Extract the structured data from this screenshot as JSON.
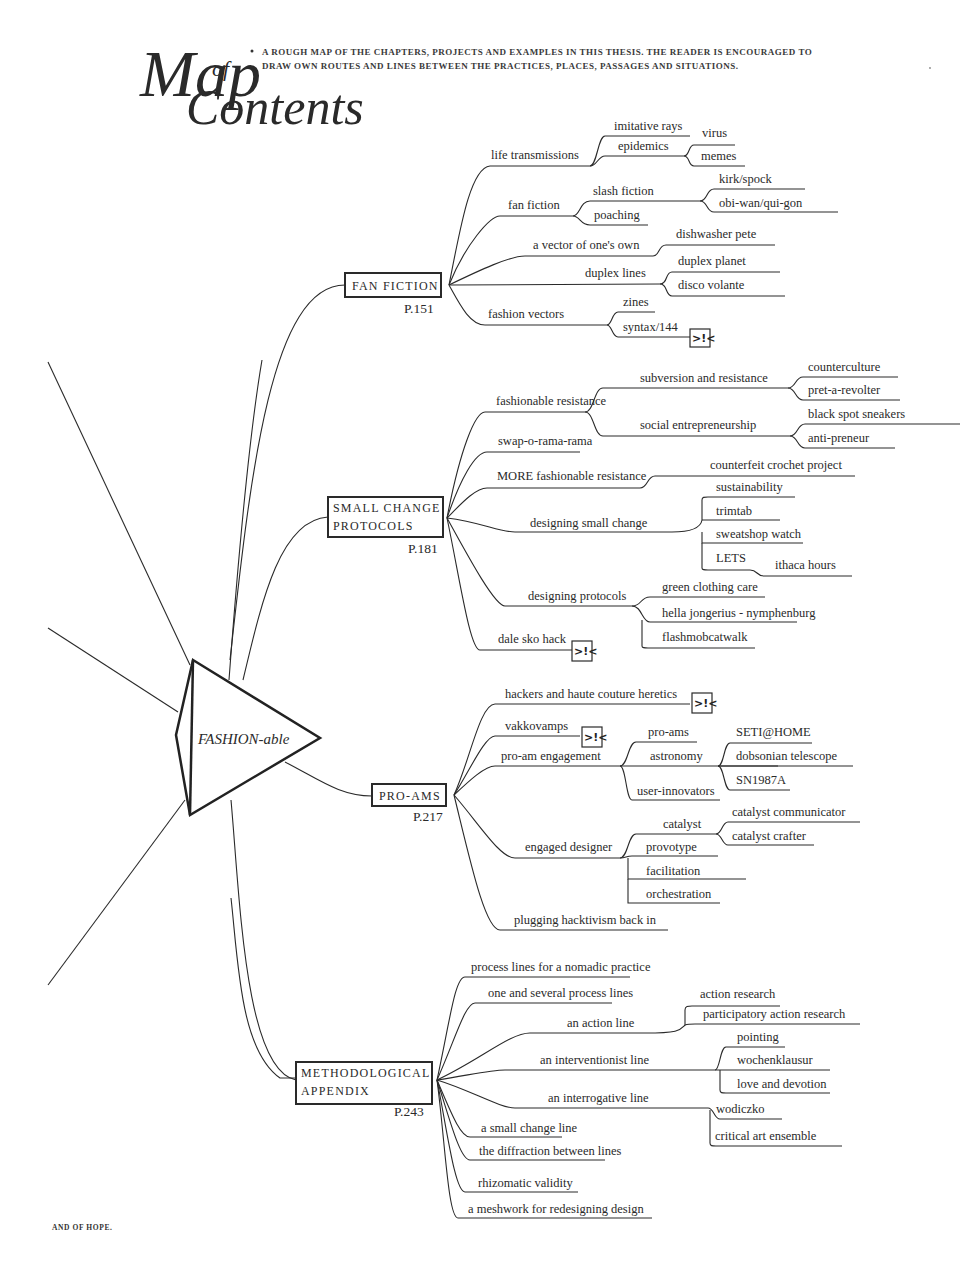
{
  "header": {
    "title_map": "Map",
    "title_of": "of",
    "title_contents": "Contents",
    "intro_line1": "A ROUGH MAP OF THE CHAPTERS, PROJECTS AND EXAMPLES IN THIS THESIS. THE READER IS ENCOURAGED TO",
    "intro_line2": "DRAW OWN ROUTES AND LINES BETWEEN THE PRACTICES, PLACES, PASSAGES AND SITUATIONS."
  },
  "center": {
    "label": "FASHION-able",
    "icon": "triangle-node-icon"
  },
  "footer": {
    "text": "AND OF HOPE."
  },
  "crossref_icon": {
    "glyph": ">!<",
    "name": "crossref-icon"
  },
  "chapters": {
    "fan_fiction": {
      "title": "FAN FICTION",
      "page": "P.151",
      "branches": {
        "life_transmissions": "life transmissions",
        "imitative_rays": "imitative rays",
        "epidemics": "epidemics",
        "virus": "virus",
        "memes": "memes",
        "fan_fiction": "fan fiction",
        "slash_fiction": "slash fiction",
        "kirk_spock": "kirk/spock",
        "obi_wan": "obi-wan/qui-gon",
        "poaching": "poaching",
        "vector": "a vector of one's own",
        "dishwasher": "dishwasher pete",
        "duplex_lines": "duplex lines",
        "duplex_planet": "duplex planet",
        "disco_volante": "disco volante",
        "fashion_vectors": "fashion vectors",
        "zines": "zines",
        "syntax": "syntax/144"
      }
    },
    "small_change": {
      "title_line1": "SMALL CHANGE",
      "title_line2": "PROTOCOLS",
      "page": "P.181",
      "branches": {
        "fashionable_resistance": "fashionable resistance",
        "subversion": "subversion and resistance",
        "counterculture": "counterculture",
        "pret": "pret-a-revolter",
        "social_entre": "social entrepreneurship",
        "black_spot": "black spot sneakers",
        "anti_preneur": "anti-preneur",
        "swap": "swap-o-rama-rama",
        "more_fr": "MORE  fashionable resistance",
        "counterfeit": "counterfeit crochet project",
        "designing_sc": "designing small change",
        "sustainability": "sustainability",
        "trimtab": "trimtab",
        "sweatshop": "sweatshop watch",
        "lets": "LETS",
        "ithaca": "ithaca hours",
        "designing_protocols": "designing protocols",
        "green": "green clothing care",
        "hella": "hella jongerius - nymphenburg",
        "flashmob": "flashmobcatwalk",
        "dale": "dale sko hack"
      }
    },
    "pro_ams": {
      "title": "PRO-AMS",
      "page": "P.217",
      "branches": {
        "hackers": "hackers and haute couture heretics",
        "vakkovamps": "vakkovamps",
        "pro_am_engagement": "pro-am engagement",
        "pro_ams": "pro-ams",
        "astronomy": "astronomy",
        "seti": "SETI@HOME",
        "dobsonian": "dobsonian telescope",
        "sn1987a": "SN1987A",
        "user_innovators": "user-innovators",
        "engaged_designer": "engaged designer",
        "catalyst": "catalyst",
        "catalyst_comm": "catalyst communicator",
        "catalyst_crafter": "catalyst crafter",
        "provotype": "provotype",
        "facilitation": "facilitation",
        "orchestration": "orchestration",
        "plugging": "plugging hacktivism back in"
      }
    },
    "appendix": {
      "title_line1": "METHODOLOGICAL",
      "title_line2": "APPENDIX",
      "page": "P.243",
      "branches": {
        "process_lines": "process lines for a nomadic practice",
        "one_several": "one and several process lines",
        "action_line": "an action line",
        "action_research": "action research",
        "participatory": "participatory action research",
        "interventionist": "an interventionist line",
        "pointing": "pointing",
        "wochenklausur": "wochenklausur",
        "love": "love and devotion",
        "interrogative": "an interrogative line",
        "wodiczko": "wodiczko",
        "critical_art": "critical art ensemble",
        "small_change_line": "a small change line",
        "diffraction": "the diffraction between lines",
        "rhizomatic": "rhizomatic validity",
        "meshwork": "a meshwork for redesigning design"
      }
    }
  }
}
